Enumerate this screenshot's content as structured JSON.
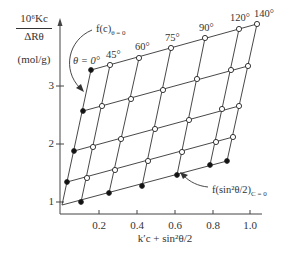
{
  "chart_data": {
    "type": "scatter",
    "subtype": "Zimm-style grid plot",
    "title": "",
    "ylabel_numerator": "10⁶Kc",
    "ylabel_denominator": "ΔRθ",
    "ylabel_unit": "(mol/g)",
    "xlabel": "k′c + sin²θ/2",
    "xlim": [
      0,
      1.1
    ],
    "ylim": [
      0.8,
      3.6
    ],
    "x_ticks": [
      "0.2",
      "0.4",
      "0.6",
      "0.8",
      "1.0"
    ],
    "y_ticks": [
      "1",
      "2",
      "3"
    ],
    "grid": false,
    "legend": "none",
    "angle_labels": [
      "θ = 0°",
      "45°",
      "60°",
      "75°",
      "90°",
      "120°",
      "140°"
    ],
    "annotations": [
      {
        "text": "f(c)θ = 0",
        "note": "arrow pointing to extrapolated θ=0 line"
      },
      {
        "text": "f(sin²θ/2)C = 0",
        "note": "arrow pointing to extrapolated c=0 line"
      }
    ],
    "series": [
      {
        "name": "row1 (highest c)",
        "points": [
          [
            0.16,
            3.27
          ],
          [
            0.26,
            3.36
          ],
          [
            0.41,
            3.48
          ],
          [
            0.58,
            3.65
          ],
          [
            0.75,
            3.82
          ],
          [
            0.94,
            3.98
          ],
          [
            1.03,
            4.06
          ]
        ],
        "extrapolated_first": true
      },
      {
        "name": "row2",
        "points": [
          [
            0.12,
            2.57
          ],
          [
            0.22,
            2.67
          ],
          [
            0.37,
            2.79
          ],
          [
            0.54,
            2.95
          ],
          [
            0.71,
            3.14
          ],
          [
            0.89,
            3.29
          ],
          [
            0.98,
            3.36
          ]
        ],
        "extrapolated_first": true
      },
      {
        "name": "row3",
        "points": [
          [
            0.07,
            1.88
          ],
          [
            0.17,
            1.95
          ],
          [
            0.31,
            2.09
          ],
          [
            0.49,
            2.26
          ],
          [
            0.67,
            2.41
          ],
          [
            0.84,
            2.6
          ],
          [
            0.93,
            2.65
          ]
        ],
        "extrapolated_first": true
      },
      {
        "name": "row4",
        "points": [
          [
            0.03,
            1.36
          ],
          [
            0.14,
            1.43
          ],
          [
            0.28,
            1.57
          ],
          [
            0.46,
            1.72
          ],
          [
            0.63,
            1.88
          ],
          [
            0.81,
            2.05
          ],
          [
            0.9,
            2.14
          ]
        ],
        "extrapolated_first": true
      },
      {
        "name": "c = 0 (extrapolated)",
        "points": [
          [
            0.01,
            0.95
          ],
          [
            0.1,
            1.0
          ],
          [
            0.25,
            1.16
          ],
          [
            0.42,
            1.28
          ],
          [
            0.61,
            1.47
          ],
          [
            0.78,
            1.64
          ],
          [
            0.87,
            1.71
          ]
        ],
        "all_extrapolated": true
      }
    ]
  },
  "geometry": {
    "axis_origin_px": [
      60,
      214
    ],
    "grid_px": [
      [
        [
          91,
          70
        ],
        [
          110,
          65
        ],
        [
          139,
          58
        ],
        [
          171,
          48
        ],
        [
          205,
          38
        ],
        [
          239,
          29
        ],
        [
          257,
          24
        ]
      ],
      [
        [
          83,
          111
        ],
        [
          102,
          106
        ],
        [
          131,
          99
        ],
        [
          163,
          90
        ],
        [
          197,
          79
        ],
        [
          231,
          70
        ],
        [
          248,
          66
        ]
      ],
      [
        [
          74,
          151
        ],
        [
          93,
          147
        ],
        [
          121,
          139
        ],
        [
          155,
          129
        ],
        [
          189,
          120
        ],
        [
          222,
          109
        ],
        [
          239,
          106
        ]
      ],
      [
        [
          67,
          182
        ],
        [
          87,
          178
        ],
        [
          115,
          170
        ],
        [
          148,
          161
        ],
        [
          182,
          152
        ],
        [
          216,
          142
        ],
        [
          233,
          137
        ]
      ],
      [
        [
          62,
          205
        ],
        [
          81,
          202
        ],
        [
          109,
          193
        ],
        [
          142,
          186
        ],
        [
          177,
          175
        ],
        [
          210,
          165
        ],
        [
          227,
          161
        ]
      ]
    ],
    "ytick_px": [
      {
        "label": "1",
        "y": 202
      },
      {
        "label": "2",
        "y": 144
      },
      {
        "label": "3",
        "y": 86
      }
    ],
    "xtick_px": [
      {
        "label": "0.2",
        "x": 99
      },
      {
        "label": "0.4",
        "x": 137
      },
      {
        "label": "0.6",
        "x": 175
      },
      {
        "label": "0.8",
        "x": 213
      },
      {
        "label": "1.0",
        "x": 250
      }
    ]
  },
  "labels": {
    "y_num": "10⁶Kc",
    "y_den": "ΔRθ",
    "y_unit": "(mol/g)",
    "x": "k′c + sin²θ/2",
    "ann_fc": "f(c)",
    "ann_fc_sub": "θ = 0",
    "ann_fs": "f(sin²θ/2)",
    "ann_fs_sub": "C = 0",
    "theta0": "θ = 0°",
    "theta45": "45°",
    "theta60": "60°",
    "theta75": "75°",
    "theta90": "90°",
    "theta120": "120°",
    "theta140": "140°",
    "yt1": "1",
    "yt2": "2",
    "yt3": "3",
    "xt1": "0.2",
    "xt2": "0.4",
    "xt3": "0.6",
    "xt4": "0.8",
    "xt5": "1.0"
  }
}
